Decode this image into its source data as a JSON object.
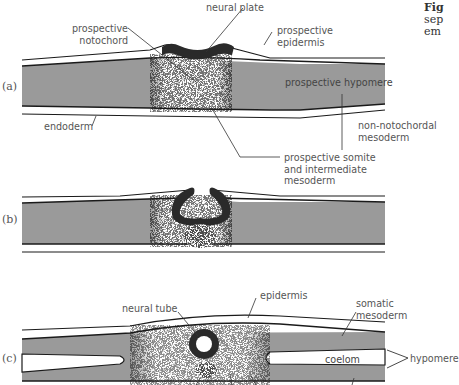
{
  "caption": {
    "line1": "Fig",
    "line2": "sep",
    "line3": "em"
  },
  "colors": {
    "mesoderm_gray": "#9a9a9a",
    "outline": "#1a1a1a",
    "label_text": "#555555",
    "neural_dark": "#2a2a2a"
  },
  "panels": [
    {
      "id": "a",
      "tag": "(a)",
      "labels": {
        "neural_plate": "neural plate",
        "prospective_notochord_1": "prospective",
        "prospective_notochord_2": "notochord",
        "prospective_epidermis_1": "prospective",
        "prospective_epidermis_2": "epidermis",
        "prospective_hypomere": "prospective hypomere",
        "endoderm": "endoderm",
        "non_notochordal_1": "non-notochordal",
        "non_notochordal_2": "mesoderm",
        "somite_1": "prospective somite",
        "somite_2": "and intermediate",
        "somite_3": "mesoderm"
      }
    },
    {
      "id": "b",
      "tag": "(b)"
    },
    {
      "id": "c",
      "tag": "(c)",
      "labels": {
        "neural_tube": "neural tube",
        "epidermis": "epidermis",
        "somatic_1": "somatic",
        "somatic_2": "mesoderm",
        "coelom": "coelom",
        "hypomere": "hypomere"
      }
    }
  ]
}
